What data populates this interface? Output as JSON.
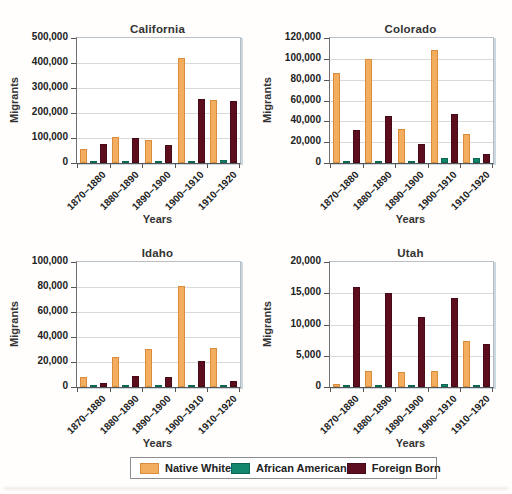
{
  "legend": {
    "items": [
      {
        "label": "Native White",
        "color": "#F2AD5F",
        "border": "#D98C3B"
      },
      {
        "label": "African American",
        "color": "#12866C",
        "border": "#0B6753"
      },
      {
        "label": "Foreign Born",
        "color": "#5C0E1E",
        "border": "#470A17"
      }
    ]
  },
  "chart_data": [
    {
      "type": "bar",
      "title": "California",
      "xlabel": "Years",
      "ylabel": "Migrants",
      "categories": [
        "1870–1880",
        "1880–1890",
        "1890–1900",
        "1900–1910",
        "1910–1920"
      ],
      "series": [
        {
          "name": "Native White",
          "values": [
            55000,
            105000,
            90000,
            420000,
            253000
          ]
        },
        {
          "name": "African American",
          "values": [
            1000,
            1000,
            1000,
            8000,
            13000
          ]
        },
        {
          "name": "Foreign Born",
          "values": [
            74000,
            100000,
            72000,
            256000,
            246000
          ]
        }
      ],
      "ylim": [
        0,
        500000
      ],
      "yticks": [
        "0",
        "100,000",
        "200,000",
        "300,000",
        "400,000",
        "500,000"
      ],
      "grid": true,
      "legend_position": "shared-bottom"
    },
    {
      "type": "bar",
      "title": "Colorado",
      "xlabel": "Years",
      "ylabel": "Migrants",
      "categories": [
        "1870–1880",
        "1880–1890",
        "1890–1900",
        "1900–1910",
        "1910–1920"
      ],
      "series": [
        {
          "name": "Native White",
          "values": [
            86000,
            100000,
            33000,
            108000,
            28000
          ]
        },
        {
          "name": "African American",
          "values": [
            500,
            500,
            500,
            5000,
            4500
          ]
        },
        {
          "name": "Foreign Born",
          "values": [
            32000,
            45000,
            18000,
            47000,
            8500
          ]
        }
      ],
      "ylim": [
        0,
        120000
      ],
      "yticks": [
        "0",
        "20,000",
        "40,000",
        "60,000",
        "80,000",
        "100,000",
        "120,000"
      ],
      "grid": true,
      "legend_position": "shared-bottom"
    },
    {
      "type": "bar",
      "title": "Idaho",
      "xlabel": "Years",
      "ylabel": "Migrants",
      "categories": [
        "1870–1880",
        "1880–1890",
        "1890–1900",
        "1900–1910",
        "1910–1920"
      ],
      "series": [
        {
          "name": "Native White",
          "values": [
            8000,
            24000,
            30000,
            81000,
            31000
          ]
        },
        {
          "name": "African American",
          "values": [
            200,
            300,
            300,
            400,
            400
          ]
        },
        {
          "name": "Foreign Born",
          "values": [
            3000,
            9000,
            8000,
            21000,
            5000
          ]
        }
      ],
      "ylim": [
        0,
        100000
      ],
      "yticks": [
        "0",
        "20,000",
        "40,000",
        "60,000",
        "80,000",
        "100,000"
      ],
      "grid": true,
      "legend_position": "shared-bottom"
    },
    {
      "type": "bar",
      "title": "Utah",
      "xlabel": "Years",
      "ylabel": "Migrants",
      "categories": [
        "1870–1880",
        "1880–1890",
        "1890–1900",
        "1900–1910",
        "1910–1920"
      ],
      "series": [
        {
          "name": "Native White",
          "values": [
            400,
            2600,
            2400,
            2600,
            7400
          ]
        },
        {
          "name": "African American",
          "values": [
            100,
            100,
            100,
            400,
            300
          ]
        },
        {
          "name": "Foreign Born",
          "values": [
            16000,
            15100,
            11200,
            14200,
            6900
          ]
        }
      ],
      "ylim": [
        0,
        20000
      ],
      "yticks": [
        "0",
        "5,000",
        "10,000",
        "15,000",
        "20,000"
      ],
      "grid": true,
      "legend_position": "shared-bottom"
    }
  ]
}
